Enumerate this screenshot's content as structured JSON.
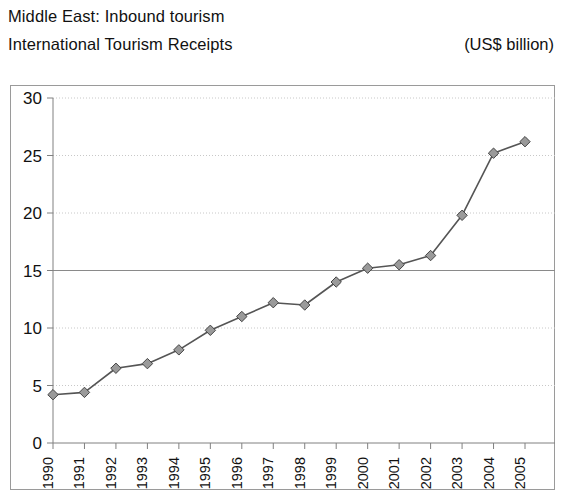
{
  "header": {
    "title_line1": "Middle East: Inbound tourism",
    "title_line2": "International Tourism Receipts",
    "units": "(US$ billion)"
  },
  "chart_data": {
    "type": "line",
    "subtitle": "International Tourism Receipts",
    "units": "(US$ billion)",
    "xlabel": "",
    "ylabel": "",
    "categories": [
      "1990",
      "1991",
      "1992",
      "1993",
      "1994",
      "1995",
      "1996",
      "1997",
      "1998",
      "1999",
      "2000",
      "2001",
      "2002",
      "2003",
      "2004",
      "2005"
    ],
    "values": [
      4.2,
      4.4,
      6.5,
      6.9,
      8.1,
      9.8,
      11.0,
      12.2,
      12.0,
      14.0,
      15.2,
      15.5,
      16.3,
      19.8,
      25.2,
      26.2
    ],
    "series": [
      {
        "name": "International Tourism Receipts",
        "values": [
          4.2,
          4.4,
          6.5,
          6.9,
          8.1,
          9.8,
          11.0,
          12.2,
          12.0,
          14.0,
          15.2,
          15.5,
          16.3,
          19.8,
          25.2,
          26.2
        ],
        "marker": "diamond",
        "line_color": "#555555",
        "marker_color": "#808080"
      }
    ],
    "ylim": [
      0,
      30
    ],
    "yticks": [
      0,
      5,
      10,
      15,
      20,
      25,
      30
    ],
    "ytick_labels": [
      "0",
      "5",
      "10",
      "15",
      "20",
      "25",
      "30"
    ],
    "grid": true,
    "grid_style": "dotted",
    "emphasized_gridline": 15,
    "legend": false,
    "xtick_rotation": -90,
    "colors": {
      "axis": "#808080",
      "grid": "#c8c8c8",
      "grid_major": "#8a8a8a",
      "line": "#555555",
      "marker_fill": "#9a9a9a",
      "marker_edge": "#444444",
      "frame": "#9a9a9a",
      "text": "#111111"
    }
  }
}
